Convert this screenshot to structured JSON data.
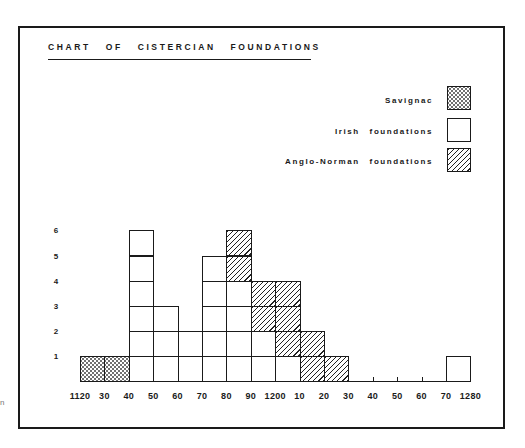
{
  "title": "CHART OF CISTERCIAN FOUNDATIONS",
  "legend": [
    {
      "label": "Savignac",
      "pattern": "dotted"
    },
    {
      "label": "Irish foundations",
      "pattern": "plain"
    },
    {
      "label": "Anglo-Norman foundations",
      "pattern": "hatched"
    }
  ],
  "y_ticks": [
    "6",
    "5",
    "4",
    "3",
    "2",
    "1"
  ],
  "x_ticks": [
    "1120",
    "30",
    "40",
    "50",
    "60",
    "70",
    "80",
    "90",
    "1200",
    "10",
    "20",
    "30",
    "40",
    "50",
    "60",
    "70",
    "1280"
  ],
  "stray_text": "n",
  "chart_data": {
    "type": "bar",
    "stacked": true,
    "title": "CHART OF CISTERCIAN FOUNDATIONS",
    "xlabel": "",
    "ylabel": "",
    "ylim": [
      0,
      6
    ],
    "categories": [
      "1120-30",
      "1130-40",
      "1140-50",
      "1150-60",
      "1160-70",
      "1170-80",
      "1180-90",
      "1190-1200",
      "1200-10",
      "1210-20",
      "1220-30",
      "1230-40",
      "1240-50",
      "1250-60",
      "1260-70",
      "1270-80"
    ],
    "series": [
      {
        "name": "Savignac",
        "values": [
          1,
          1,
          0,
          0,
          0,
          0,
          0,
          0,
          0,
          0,
          0,
          0,
          0,
          0,
          0,
          0
        ]
      },
      {
        "name": "Irish foundations",
        "values": [
          0,
          0,
          6,
          3,
          2,
          5,
          4,
          2,
          1,
          0,
          0,
          0,
          0,
          0,
          0,
          1
        ]
      },
      {
        "name": "Anglo-Norman foundations",
        "values": [
          0,
          0,
          0,
          0,
          0,
          0,
          2,
          2,
          3,
          2,
          1,
          0,
          0,
          0,
          0,
          0
        ]
      }
    ],
    "x_tick_labels": [
      "1120",
      "30",
      "40",
      "50",
      "60",
      "70",
      "80",
      "90",
      "1200",
      "10",
      "20",
      "30",
      "40",
      "50",
      "60",
      "70",
      "1280"
    ],
    "y_tick_labels": [
      "1",
      "2",
      "3",
      "4",
      "5",
      "6"
    ],
    "legend_position": "top-right",
    "grid": false
  }
}
